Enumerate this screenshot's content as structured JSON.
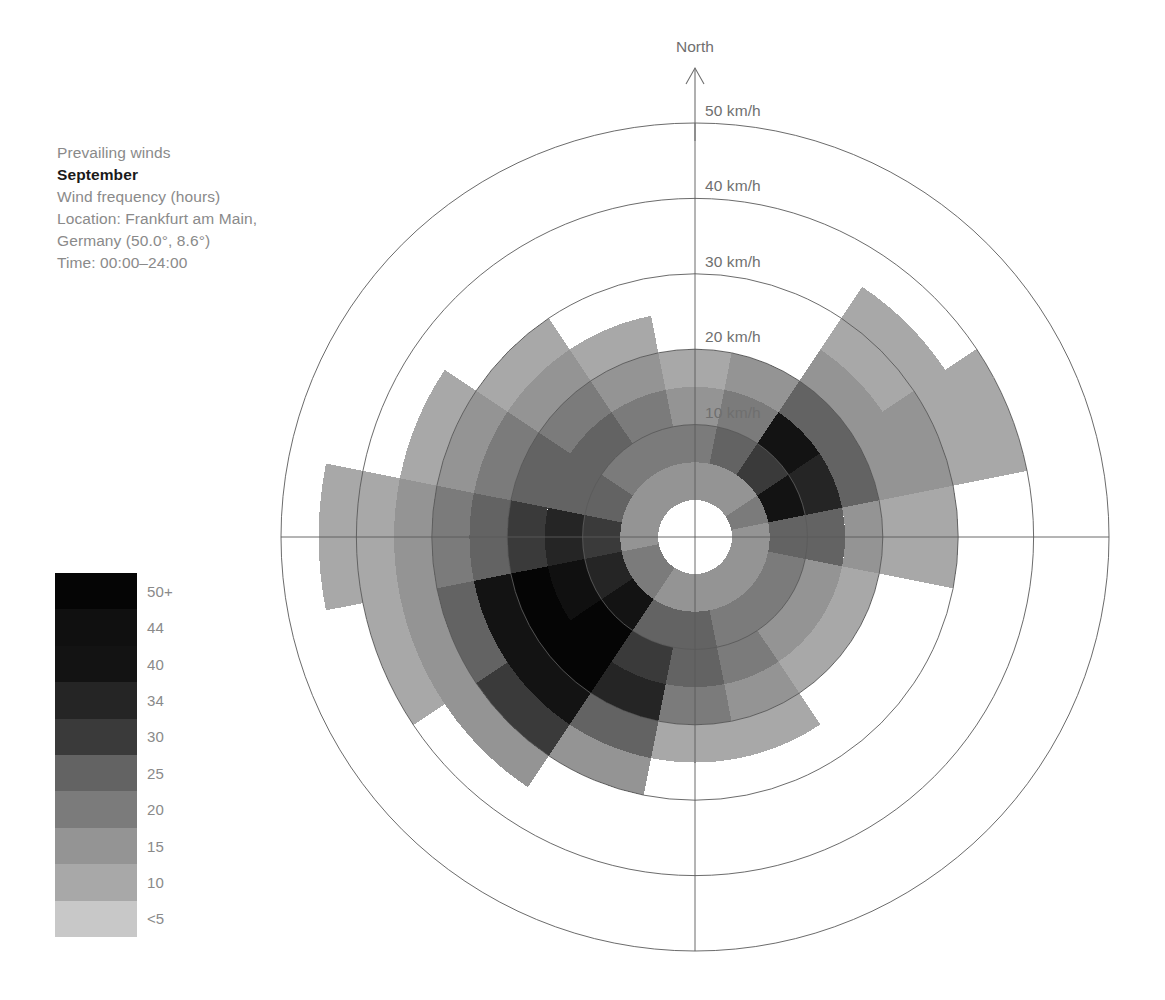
{
  "caption": {
    "heading": "Prevailing winds",
    "month": "September",
    "metric": "Wind frequency (hours)",
    "location_line1": "Location: Frankfurt am Main,",
    "location_line2": "Germany (50.0°, 8.6°)",
    "time": "Time: 00:00–24:00"
  },
  "legend": {
    "title": "",
    "entries": [
      {
        "label": "50+",
        "color": "#050505"
      },
      {
        "label": "44",
        "color": "#101010"
      },
      {
        "label": "40",
        "color": "#131313"
      },
      {
        "label": "34",
        "color": "#252525"
      },
      {
        "label": "30",
        "color": "#3a3a3a"
      },
      {
        "label": "25",
        "color": "#636363"
      },
      {
        "label": "20",
        "color": "#7b7b7b"
      },
      {
        "label": "15",
        "color": "#949494"
      },
      {
        "label": "10",
        "color": "#a8a8a8"
      },
      {
        "label": "<5",
        "color": "#c8c8c8"
      }
    ]
  },
  "axes": {
    "north_label": "North",
    "ring_labels": [
      "10 km/h",
      "20 km/h",
      "30 km/h",
      "40 km/h",
      "50 km/h"
    ],
    "ring_values": [
      10,
      20,
      30,
      40,
      50
    ],
    "units": "km/h"
  },
  "chart_data": {
    "type": "windrose",
    "subtitle": "Wind frequency (hours)",
    "location": "Frankfurt am Main, Germany (50.0°, 8.6°)",
    "time_range": "00:00–24:00",
    "radial_axis": {
      "label": "Wind speed (km/h)",
      "ticks": [
        10,
        20,
        30,
        40,
        50
      ],
      "rlim": [
        0,
        50
      ],
      "inner_hole": 4.5,
      "grid": true
    },
    "angular_axis": {
      "label": "Compass direction",
      "sector_count": 16,
      "sector_width_deg": 22.5,
      "directions": [
        "N",
        "NNE",
        "NE",
        "ENE",
        "E",
        "ESE",
        "SE",
        "SSE",
        "S",
        "SSW",
        "SW",
        "WSW",
        "W",
        "WNW",
        "NW",
        "NNW"
      ]
    },
    "color_scale": {
      "name": "wind frequency (hours)",
      "breaks": [
        5,
        10,
        15,
        20,
        25,
        30,
        34,
        40,
        44,
        50
      ],
      "labels": [
        "<5",
        "10",
        "15",
        "20",
        "25",
        "30",
        "34",
        "40",
        "44",
        "50+"
      ],
      "colors": [
        "#c8c8c8",
        "#a8a8a8",
        "#949494",
        "#7b7b7b",
        "#636363",
        "#3a3a3a",
        "#252525",
        "#131313",
        "#101010",
        "#050505"
      ]
    },
    "note": "Each sector is a compass direction; each concentric band is a 5 km/h wind-speed bin. Cell value = hours at that direction and speed, encoded by grey level. null = no data / not drawn.",
    "speed_bins": [
      [
        0,
        5
      ],
      [
        5,
        10
      ],
      [
        10,
        15
      ],
      [
        15,
        20
      ],
      [
        20,
        25
      ],
      [
        25,
        30
      ],
      [
        30,
        35
      ],
      [
        35,
        40
      ],
      [
        40,
        45
      ],
      [
        45,
        50
      ]
    ],
    "sectors": [
      {
        "dir": "N",
        "angle": 0,
        "max_speed": 20,
        "cells": [
          10,
          15,
          12,
          8,
          null,
          null,
          null,
          null,
          null,
          null
        ]
      },
      {
        "dir": "NNE",
        "angle": 22.5,
        "max_speed": 20,
        "cells": [
          12,
          20,
          18,
          10,
          null,
          null,
          null,
          null,
          null,
          null
        ]
      },
      {
        "dir": "NE",
        "angle": 45,
        "max_speed": 35,
        "cells": [
          14,
          28,
          36,
          22,
          12,
          8,
          6,
          null,
          null,
          null
        ]
      },
      {
        "dir": "ENE",
        "angle": 67.5,
        "max_speed": 40,
        "cells": [
          16,
          34,
          30,
          20,
          14,
          10,
          8,
          6,
          null,
          null
        ]
      },
      {
        "dir": "E",
        "angle": 90,
        "max_speed": 30,
        "cells": [
          14,
          22,
          20,
          12,
          9,
          6,
          null,
          null,
          null,
          null
        ]
      },
      {
        "dir": "ESE",
        "angle": 112.5,
        "max_speed": 20,
        "cells": [
          12,
          18,
          14,
          9,
          null,
          null,
          null,
          null,
          null,
          null
        ]
      },
      {
        "dir": "SE",
        "angle": 135,
        "max_speed": 20,
        "cells": [
          10,
          16,
          12,
          8,
          null,
          null,
          null,
          null,
          null,
          null
        ]
      },
      {
        "dir": "SSE",
        "angle": 157.5,
        "max_speed": 25,
        "cells": [
          11,
          18,
          16,
          12,
          7,
          null,
          null,
          null,
          null,
          null
        ]
      },
      {
        "dir": "S",
        "angle": 180,
        "max_speed": 25,
        "cells": [
          12,
          20,
          22,
          16,
          9,
          null,
          null,
          null,
          null,
          null
        ]
      },
      {
        "dir": "SSW",
        "angle": 202.5,
        "max_speed": 30,
        "cells": [
          14,
          24,
          26,
          30,
          20,
          12,
          null,
          null,
          null,
          null
        ]
      },
      {
        "dir": "SW",
        "angle": 225,
        "max_speed": 35,
        "cells": [
          18,
          34,
          44,
          52,
          36,
          25,
          14,
          null,
          null,
          null
        ]
      },
      {
        "dir": "WSW",
        "angle": 247.5,
        "max_speed": 40,
        "cells": [
          16,
          30,
          40,
          50,
          34,
          22,
          14,
          9,
          null,
          null
        ]
      },
      {
        "dir": "W",
        "angle": 270,
        "max_speed": 45,
        "cells": [
          14,
          26,
          30,
          28,
          22,
          16,
          12,
          9,
          7,
          null
        ]
      },
      {
        "dir": "WNW",
        "angle": 292.5,
        "max_speed": 35,
        "cells": [
          12,
          22,
          24,
          20,
          16,
          12,
          9,
          null,
          null,
          null
        ]
      },
      {
        "dir": "NW",
        "angle": 315,
        "max_speed": 30,
        "cells": [
          11,
          18,
          20,
          16,
          12,
          8,
          null,
          null,
          null,
          null
        ]
      },
      {
        "dir": "NNW",
        "angle": 337.5,
        "max_speed": 25,
        "cells": [
          10,
          16,
          15,
          10,
          7,
          null,
          null,
          null,
          null,
          null
        ]
      }
    ]
  },
  "geometry": {
    "cx": 695,
    "cy": 537,
    "r_inner_px": 37,
    "r_per_10kmh_px": 79,
    "r_max_px": 414
  }
}
